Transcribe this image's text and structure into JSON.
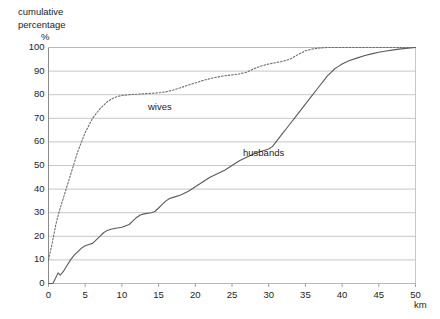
{
  "chart_data": {
    "type": "line",
    "title": "",
    "ylabel": "cumulative percentage %",
    "ylabel_lines": [
      "cumulative",
      "percentage"
    ],
    "ypercent_symbol": "%",
    "xlabel": "km",
    "xlim": [
      0,
      50
    ],
    "ylim": [
      0,
      100
    ],
    "xticks": [
      0,
      5,
      10,
      15,
      20,
      25,
      30,
      35,
      40,
      45,
      50
    ],
    "yticks": [
      0,
      10,
      20,
      30,
      40,
      50,
      60,
      70,
      80,
      90,
      100
    ],
    "grid": "horizontal",
    "legend_position": "inline-annotation",
    "series": [
      {
        "name": "wives",
        "style": "dotted",
        "color": "#6e6e6e",
        "points": [
          [
            0,
            10
          ],
          [
            0.5,
            17
          ],
          [
            1,
            25
          ],
          [
            1.5,
            31
          ],
          [
            2,
            36
          ],
          [
            2.5,
            41
          ],
          [
            3,
            46
          ],
          [
            3.5,
            51
          ],
          [
            4,
            56
          ],
          [
            4.5,
            60
          ],
          [
            5,
            64
          ],
          [
            5.5,
            67
          ],
          [
            6,
            70
          ],
          [
            6.5,
            72
          ],
          [
            7,
            74
          ],
          [
            7.5,
            75.5
          ],
          [
            8,
            77
          ],
          [
            8.5,
            78
          ],
          [
            9,
            78.8
          ],
          [
            9.5,
            79.3
          ],
          [
            10,
            79.7
          ],
          [
            11,
            80
          ],
          [
            12,
            80.2
          ],
          [
            13,
            80.4
          ],
          [
            14,
            80.6
          ],
          [
            15,
            80.8
          ],
          [
            16,
            81.2
          ],
          [
            17,
            82
          ],
          [
            18,
            83
          ],
          [
            19,
            84
          ],
          [
            20,
            85
          ],
          [
            21,
            86
          ],
          [
            22,
            86.8
          ],
          [
            23,
            87.5
          ],
          [
            24,
            88
          ],
          [
            25,
            88.4
          ],
          [
            26,
            88.8
          ],
          [
            27,
            89.5
          ],
          [
            28,
            91
          ],
          [
            29,
            92.2
          ],
          [
            30,
            93
          ],
          [
            31,
            93.6
          ],
          [
            32,
            94.2
          ],
          [
            33,
            95.2
          ],
          [
            34,
            97
          ],
          [
            35,
            98.6
          ],
          [
            36,
            99.4
          ],
          [
            37,
            99.8
          ],
          [
            38,
            100
          ],
          [
            40,
            100
          ],
          [
            45,
            100
          ],
          [
            50,
            100
          ]
        ]
      },
      {
        "name": "husbands",
        "style": "solid",
        "color": "#5a5a5a",
        "points": [
          [
            0,
            0
          ],
          [
            0.6,
            0
          ],
          [
            1,
            2.5
          ],
          [
            1.3,
            4.5
          ],
          [
            1.6,
            3.5
          ],
          [
            2,
            5
          ],
          [
            2.5,
            7.5
          ],
          [
            3,
            10
          ],
          [
            3.5,
            12
          ],
          [
            4,
            13.5
          ],
          [
            4.5,
            15
          ],
          [
            5,
            16
          ],
          [
            5.5,
            16.5
          ],
          [
            6,
            17
          ],
          [
            6.5,
            18.5
          ],
          [
            7,
            20
          ],
          [
            7.5,
            21.5
          ],
          [
            8,
            22.5
          ],
          [
            8.5,
            23
          ],
          [
            9,
            23.3
          ],
          [
            10,
            23.8
          ],
          [
            11,
            25
          ],
          [
            11.5,
            26.5
          ],
          [
            12,
            28
          ],
          [
            12.5,
            29
          ],
          [
            13,
            29.5
          ],
          [
            14,
            30
          ],
          [
            14.5,
            30.5
          ],
          [
            15,
            32
          ],
          [
            15.5,
            33.5
          ],
          [
            16,
            35
          ],
          [
            16.5,
            36
          ],
          [
            17,
            36.5
          ],
          [
            18,
            37.5
          ],
          [
            19,
            39
          ],
          [
            20,
            41
          ],
          [
            21,
            43
          ],
          [
            22,
            45
          ],
          [
            23,
            46.5
          ],
          [
            24,
            48
          ],
          [
            25,
            50
          ],
          [
            26,
            52
          ],
          [
            27,
            53.5
          ],
          [
            28,
            55
          ],
          [
            29,
            56
          ],
          [
            29.5,
            56.5
          ],
          [
            30,
            57
          ],
          [
            30.5,
            58
          ],
          [
            31,
            60
          ],
          [
            31.5,
            62
          ],
          [
            32,
            64
          ],
          [
            32.5,
            66
          ],
          [
            33,
            68
          ],
          [
            33.5,
            70
          ],
          [
            34,
            72
          ],
          [
            34.5,
            74
          ],
          [
            35,
            76
          ],
          [
            35.5,
            78
          ],
          [
            36,
            80
          ],
          [
            36.5,
            82
          ],
          [
            37,
            84
          ],
          [
            37.5,
            86
          ],
          [
            38,
            88
          ],
          [
            38.5,
            89.5
          ],
          [
            39,
            91
          ],
          [
            39.5,
            92
          ],
          [
            40,
            93
          ],
          [
            41,
            94.5
          ],
          [
            42,
            95.5
          ],
          [
            43,
            96.5
          ],
          [
            44,
            97.3
          ],
          [
            45,
            98
          ],
          [
            46,
            98.5
          ],
          [
            47,
            99
          ],
          [
            48,
            99.4
          ],
          [
            49,
            99.7
          ],
          [
            50,
            100
          ]
        ]
      }
    ]
  },
  "axis": {
    "y_tick_labels": [
      "100",
      "90",
      "80",
      "70",
      "60",
      "50",
      "40",
      "30",
      "20",
      "10",
      "0"
    ],
    "x_tick_labels": [
      "0",
      "5",
      "10",
      "15",
      "20",
      "25",
      "30",
      "35",
      "40",
      "45",
      "50"
    ],
    "x_unit": "km",
    "y_caption_line1": "cumulative",
    "y_caption_line2": "percentage",
    "y_caption_symbol": "%"
  },
  "annotations": {
    "wives": "wives",
    "husbands": "husbands"
  },
  "colors": {
    "background": "#ffffff",
    "gridline": "#b9b9b9",
    "axis": "#8a8a8a",
    "wives_line": "#6e6e6e",
    "husbands_line": "#5a5a5a",
    "text": "#1d1d1d"
  }
}
